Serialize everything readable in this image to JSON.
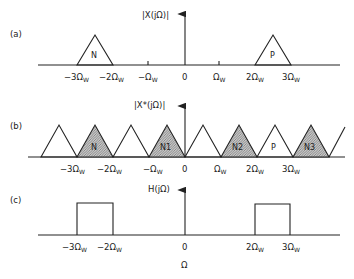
{
  "diagram": {
    "x_axis_label": "Ω",
    "colors": {
      "line": "#222222",
      "hatch": "#9a9a9a",
      "background": "#ffffff"
    },
    "panels": [
      {
        "id": "a",
        "panel_label": "(a)",
        "y_label": "|X(jΩ)|",
        "ticks": [
          {
            "text": "−3Ω",
            "sub": "W",
            "pos": -3
          },
          {
            "text": "−2Ω",
            "sub": "W",
            "pos": -2
          },
          {
            "text": "−Ω",
            "sub": "W",
            "pos": -1
          },
          {
            "text": "0",
            "sub": "",
            "pos": 0
          },
          {
            "text": "Ω",
            "sub": "W",
            "pos": 1
          },
          {
            "text": "2Ω",
            "sub": "W",
            "pos": 2
          },
          {
            "text": "3Ω",
            "sub": "W",
            "pos": 3
          }
        ],
        "shapes": [
          {
            "type": "triangle",
            "from": -3,
            "to": -2,
            "label": "N",
            "shaded": false
          },
          {
            "type": "triangle",
            "from": 2,
            "to": 3,
            "label": "P",
            "shaded": false
          }
        ]
      },
      {
        "id": "b",
        "panel_label": "(b)",
        "y_label": "|X*(jΩ)|",
        "ticks": [
          {
            "text": "−3Ω",
            "sub": "W",
            "pos": -3
          },
          {
            "text": "−2Ω",
            "sub": "W",
            "pos": -2
          },
          {
            "text": "−Ω",
            "sub": "W",
            "pos": -1
          },
          {
            "text": "0",
            "sub": "",
            "pos": 0
          },
          {
            "text": "Ω",
            "sub": "W",
            "pos": 1
          },
          {
            "text": "2Ω",
            "sub": "W",
            "pos": 2
          },
          {
            "text": "3Ω",
            "sub": "W",
            "pos": 3
          }
        ],
        "shapes": [
          {
            "type": "triangle",
            "from": -4,
            "to": -3,
            "label": "",
            "shaded": false
          },
          {
            "type": "triangle",
            "from": -3,
            "to": -2,
            "label": "N",
            "shaded": true
          },
          {
            "type": "triangle",
            "from": -2,
            "to": -1,
            "label": "",
            "shaded": false
          },
          {
            "type": "triangle",
            "from": -1,
            "to": 0,
            "label": "N1",
            "shaded": true
          },
          {
            "type": "triangle",
            "from": 0,
            "to": 1,
            "label": "",
            "shaded": false
          },
          {
            "type": "triangle",
            "from": 1,
            "to": 2,
            "label": "N2",
            "shaded": true
          },
          {
            "type": "triangle",
            "from": 2,
            "to": 3,
            "label": "P",
            "shaded": false
          },
          {
            "type": "triangle",
            "from": 3,
            "to": 4,
            "label": "N3",
            "shaded": true
          },
          {
            "type": "partial-rise",
            "from": 4,
            "to": 4.5,
            "label": "",
            "shaded": false
          }
        ]
      },
      {
        "id": "c",
        "panel_label": "(c)",
        "y_label": "H(jΩ)",
        "ticks": [
          {
            "text": "−3Ω",
            "sub": "W",
            "pos": -3
          },
          {
            "text": "−2Ω",
            "sub": "W",
            "pos": -2
          },
          {
            "text": "0",
            "sub": "",
            "pos": 0
          },
          {
            "text": "2Ω",
            "sub": "W",
            "pos": 2
          },
          {
            "text": "3Ω",
            "sub": "W",
            "pos": 3
          }
        ],
        "shapes": [
          {
            "type": "rectangle",
            "from": -3,
            "to": -2,
            "label": "",
            "shaded": false
          },
          {
            "type": "rectangle",
            "from": 2,
            "to": 3,
            "label": "",
            "shaded": false
          }
        ]
      }
    ]
  }
}
